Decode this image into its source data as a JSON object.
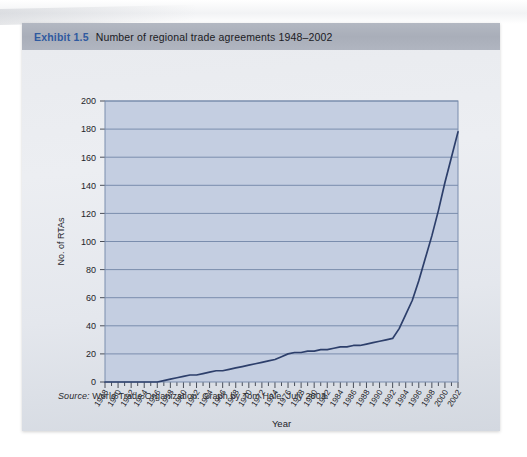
{
  "exhibit": {
    "number": "Exhibit 1.5",
    "title": "Number of regional trade agreements 1948–2002",
    "source_prefix": "Source:",
    "source_text": " World Trade Organization. Graph by Tom Hale, July 2003.",
    "accent_color": "#2f5aa0",
    "header_color": "#aeb3be",
    "plot_bg_color": "#c4cee1",
    "grid_color": "#7a8dad",
    "line_color": "#2d3f6b"
  },
  "chart_data": {
    "type": "line",
    "title": "Number of regional trade agreements 1948–2002",
    "xlabel": "Year",
    "ylabel": "No. of RTAs",
    "xlim": [
      1948,
      2002
    ],
    "ylim": [
      0,
      200
    ],
    "ytick_step": 20,
    "yticks": [
      0,
      20,
      40,
      60,
      80,
      100,
      120,
      140,
      160,
      180,
      200
    ],
    "xticks_labeled": [
      1948,
      1950,
      1952,
      1954,
      1956,
      1958,
      1960,
      1962,
      1964,
      1966,
      1968,
      1970,
      1972,
      1974,
      1976,
      1978,
      1980,
      1982,
      1984,
      1986,
      1988,
      1990,
      1992,
      1994,
      1996,
      1998,
      2000,
      2002
    ],
    "xtick_minor_every": 1,
    "grid": "horizontal",
    "legend": "none",
    "series": [
      {
        "name": "No. of RTAs",
        "x": [
          1948,
          1949,
          1950,
          1951,
          1952,
          1953,
          1954,
          1955,
          1956,
          1957,
          1958,
          1959,
          1960,
          1961,
          1962,
          1963,
          1964,
          1965,
          1966,
          1967,
          1968,
          1969,
          1970,
          1971,
          1972,
          1973,
          1974,
          1975,
          1976,
          1977,
          1978,
          1979,
          1980,
          1981,
          1982,
          1983,
          1984,
          1985,
          1986,
          1987,
          1988,
          1989,
          1990,
          1991,
          1992,
          1993,
          1994,
          1995,
          1996,
          1997,
          1998,
          1999,
          2000,
          2001,
          2002
        ],
        "y": [
          0,
          0,
          0,
          0,
          0,
          0,
          0,
          0,
          0,
          1,
          2,
          3,
          4,
          5,
          5,
          6,
          7,
          8,
          8,
          9,
          10,
          11,
          12,
          13,
          14,
          15,
          16,
          18,
          20,
          21,
          21,
          22,
          22,
          23,
          23,
          24,
          25,
          25,
          26,
          26,
          27,
          28,
          29,
          30,
          31,
          38,
          48,
          58,
          72,
          88,
          104,
          122,
          142,
          160,
          178
        ]
      }
    ]
  }
}
